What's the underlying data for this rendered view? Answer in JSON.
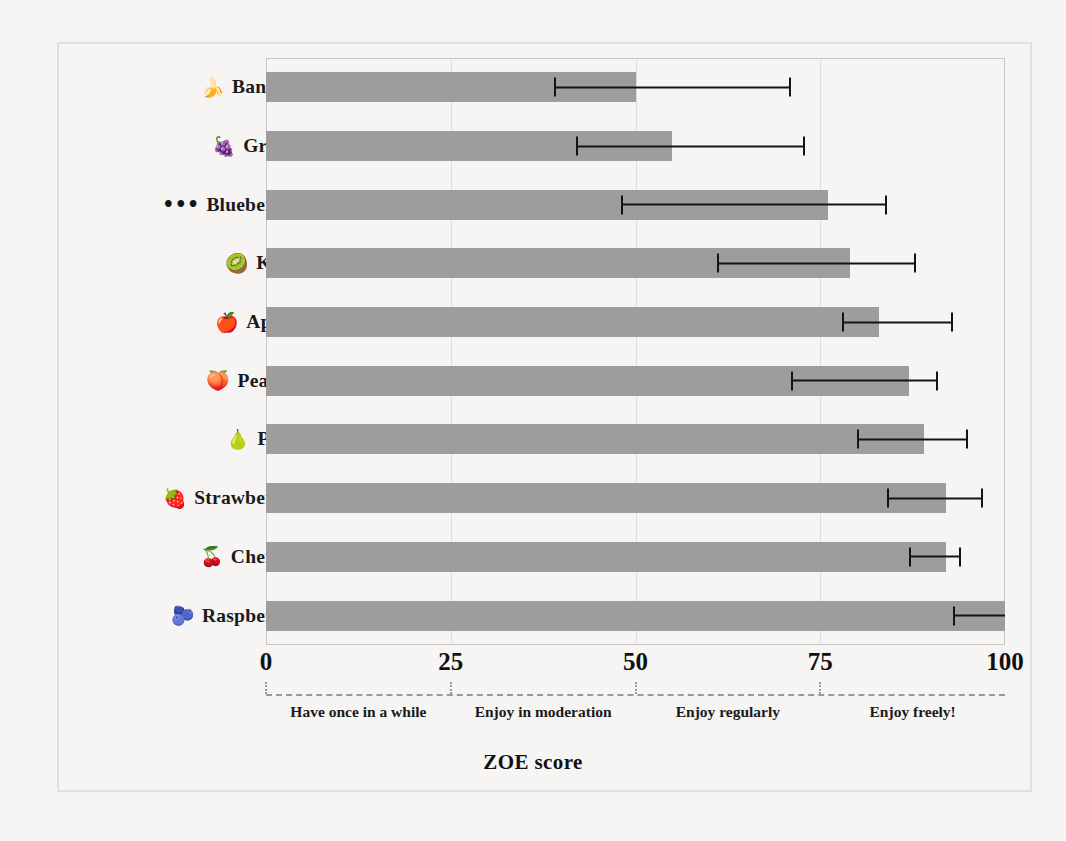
{
  "chart_data": {
    "type": "bar",
    "orientation": "horizontal",
    "title": "",
    "xlabel": "ZOE score",
    "ylabel": "",
    "xlim": [
      0,
      100
    ],
    "xticks": [
      0,
      25,
      50,
      75,
      100
    ],
    "grid": true,
    "categories": [
      "Bananas",
      "Grapes",
      "Blueberries",
      "Kiwis",
      "Apples",
      "Peaches",
      "Pears",
      "Strawberries",
      "Cherries",
      "Raspberries"
    ],
    "icons": [
      "banana-icon",
      "grapes-icon",
      "blueberries-icon",
      "kiwi-icon",
      "apple-icon",
      "peach-icon",
      "pear-icon",
      "strawberry-icon",
      "cherries-icon",
      "raspberry-icon"
    ],
    "icon_glyphs": [
      "🍌",
      "🍇",
      "•••",
      "🥝",
      "🍎",
      "🍑",
      "🍐",
      "🍓",
      "🍒",
      "🫐"
    ],
    "values": [
      50,
      55,
      76,
      79,
      83,
      87,
      89,
      92,
      92,
      100
    ],
    "err_low": [
      39,
      42,
      48,
      61,
      78,
      71,
      80,
      84,
      87,
      93
    ],
    "err_high": [
      71,
      73,
      84,
      88,
      93,
      91,
      95,
      97,
      94,
      100
    ],
    "bar_color": "#9e9d9b",
    "error_color": "#141414",
    "zones": [
      {
        "label": "Have once in a while",
        "center": 12.5,
        "range": [
          0,
          25
        ]
      },
      {
        "label": "Enjoy in moderation",
        "center": 37.5,
        "range": [
          25,
          50
        ]
      },
      {
        "label": "Enjoy regularly",
        "center": 62.5,
        "range": [
          50,
          75
        ]
      },
      {
        "label": "Enjoy freely!",
        "center": 87.5,
        "range": [
          75,
          100
        ]
      }
    ],
    "zone_tick_positions": [
      0,
      25,
      50,
      75
    ]
  },
  "colors": {
    "background": "#f6f5f3",
    "frame": "#e2e0dd",
    "plot_border": "#c9c7c4",
    "gridline": "#dedcd9",
    "text": "#1a1a1a"
  }
}
